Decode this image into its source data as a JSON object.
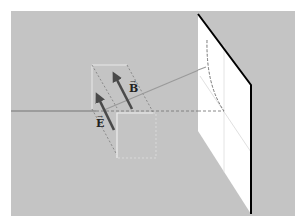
{
  "figure": {
    "background_color": "#ffffff",
    "panel_color": "#c4c4c4",
    "screen_color": "#ffffff",
    "screen_edge_color": "#000000",
    "arrow_color": "#555555",
    "beam_color": "#999999",
    "guide_color": "#888888"
  },
  "labels": {
    "electric_field": "E",
    "magnetic_field": "B"
  },
  "diagram_elements": [
    {
      "name": "electric-field-vector",
      "label": "E",
      "kind": "arrow"
    },
    {
      "name": "magnetic-field-vector",
      "label": "B",
      "kind": "arrow"
    },
    {
      "name": "propagation-axis",
      "kind": "dashed-line"
    },
    {
      "name": "projection-screen",
      "kind": "plane"
    },
    {
      "name": "wave-boxes",
      "kind": "dashed-parallelograms"
    }
  ]
}
